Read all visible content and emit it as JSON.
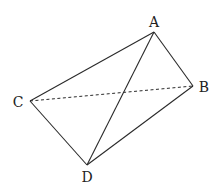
{
  "diagram": {
    "type": "tetrahedron",
    "points": {
      "A": {
        "label": "A",
        "x": 154,
        "y": 32,
        "lx": 154,
        "ly": 27
      },
      "B": {
        "label": "B",
        "x": 193,
        "y": 86,
        "lx": 204,
        "ly": 92
      },
      "C": {
        "label": "C",
        "x": 30,
        "y": 101,
        "lx": 18,
        "ly": 107
      },
      "D": {
        "label": "D",
        "x": 87,
        "y": 165,
        "lx": 87,
        "ly": 182
      }
    },
    "edges": [
      {
        "from": "A",
        "to": "C",
        "style": "solid"
      },
      {
        "from": "A",
        "to": "B",
        "style": "solid"
      },
      {
        "from": "A",
        "to": "D",
        "style": "solid"
      },
      {
        "from": "C",
        "to": "D",
        "style": "solid"
      },
      {
        "from": "D",
        "to": "B",
        "style": "solid"
      },
      {
        "from": "C",
        "to": "B",
        "style": "dashed"
      }
    ]
  }
}
